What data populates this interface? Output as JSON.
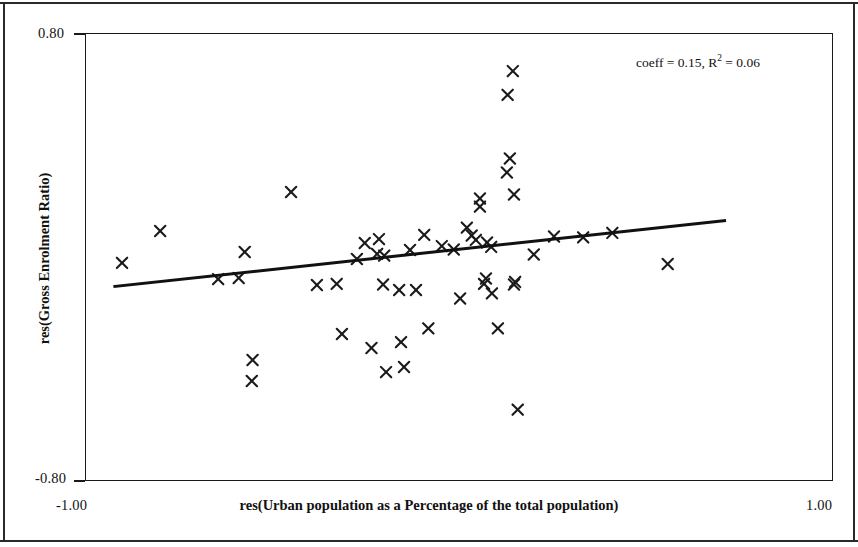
{
  "chart_data": {
    "type": "scatter",
    "title": "",
    "xlabel": "res(Urban population as a Percentage of the total population)",
    "ylabel": "res(Gross Enrolment Ratio)",
    "xlim": [
      -1.0,
      1.0
    ],
    "ylim": [
      -0.8,
      0.8
    ],
    "xticks": [
      "-1.00",
      "1.00"
    ],
    "yticks": [
      "0.80",
      "-0.80"
    ],
    "grid": false,
    "legend": null,
    "marker": "x",
    "marker_color": "#1a1a1a",
    "annotations": [
      {
        "text_plain": "coeff = 0.15, R2 = 0.06",
        "coeff_prefix": "coeff = 0.15, R",
        "coeff_sup": "2",
        "coeff_suffix": " = 0.06",
        "coeff": 0.15,
        "r_squared": 0.06
      }
    ],
    "trendline": {
      "type": "linear",
      "slope": 0.15,
      "x_start": -0.92,
      "y_start": -0.105,
      "x_end": 0.71,
      "y_end": 0.13,
      "color": "#111111",
      "width_px": 3
    },
    "points": [
      {
        "x": -0.901,
        "y": -0.021
      },
      {
        "x": -0.799,
        "y": 0.093
      },
      {
        "x": -0.644,
        "y": -0.079
      },
      {
        "x": -0.589,
        "y": -0.075
      },
      {
        "x": -0.573,
        "y": 0.018
      },
      {
        "x": -0.552,
        "y": -0.368
      },
      {
        "x": -0.554,
        "y": -0.443
      },
      {
        "x": -0.449,
        "y": 0.232
      },
      {
        "x": -0.38,
        "y": -0.1
      },
      {
        "x": -0.327,
        "y": -0.096
      },
      {
        "x": -0.313,
        "y": -0.275
      },
      {
        "x": -0.273,
        "y": -0.007
      },
      {
        "x": -0.252,
        "y": 0.05
      },
      {
        "x": -0.234,
        "y": -0.325
      },
      {
        "x": -0.214,
        "y": 0.064
      },
      {
        "x": -0.219,
        "y": 0.011
      },
      {
        "x": -0.203,
        "y": -0.098
      },
      {
        "x": -0.2,
        "y": 0.005
      },
      {
        "x": -0.195,
        "y": -0.411
      },
      {
        "x": -0.16,
        "y": -0.118
      },
      {
        "x": -0.155,
        "y": -0.304
      },
      {
        "x": -0.147,
        "y": -0.393
      },
      {
        "x": -0.131,
        "y": 0.025
      },
      {
        "x": -0.115,
        "y": -0.118
      },
      {
        "x": -0.093,
        "y": 0.079
      },
      {
        "x": -0.082,
        "y": -0.255
      },
      {
        "x": -0.046,
        "y": 0.039
      },
      {
        "x": -0.014,
        "y": 0.027
      },
      {
        "x": 0.003,
        "y": -0.148
      },
      {
        "x": 0.021,
        "y": 0.105
      },
      {
        "x": 0.034,
        "y": 0.077
      },
      {
        "x": 0.045,
        "y": 0.061
      },
      {
        "x": 0.056,
        "y": 0.209
      },
      {
        "x": 0.056,
        "y": 0.18
      },
      {
        "x": 0.067,
        "y": -0.096
      },
      {
        "x": 0.072,
        "y": -0.077
      },
      {
        "x": 0.075,
        "y": 0.052
      },
      {
        "x": 0.086,
        "y": 0.036
      },
      {
        "x": 0.088,
        "y": -0.13
      },
      {
        "x": 0.104,
        "y": -0.255
      },
      {
        "x": 0.136,
        "y": 0.352
      },
      {
        "x": 0.128,
        "y": 0.302
      },
      {
        "x": 0.147,
        "y": 0.223
      },
      {
        "x": 0.147,
        "y": -0.098
      },
      {
        "x": 0.15,
        "y": -0.089
      },
      {
        "x": 0.157,
        "y": -0.545
      },
      {
        "x": 0.2,
        "y": 0.009
      },
      {
        "x": 0.254,
        "y": 0.073
      },
      {
        "x": 0.332,
        "y": 0.07
      },
      {
        "x": 0.41,
        "y": 0.086
      },
      {
        "x": 0.558,
        "y": -0.025
      },
      {
        "x": 0.144,
        "y": 0.664
      },
      {
        "x": 0.13,
        "y": 0.579
      }
    ]
  },
  "axes": {
    "y_top_tick": "0.80",
    "y_bottom_tick": "-0.80",
    "x_left_tick": "-1.00",
    "x_right_tick": "1.00",
    "x_title": "res(Urban population as a Percentage of the total population)",
    "y_title": "res(Gross Enrolment Ratio)"
  },
  "annotation": {
    "prefix": "coeff = 0.15, R",
    "superscript": "2",
    "suffix": " = 0.06"
  }
}
